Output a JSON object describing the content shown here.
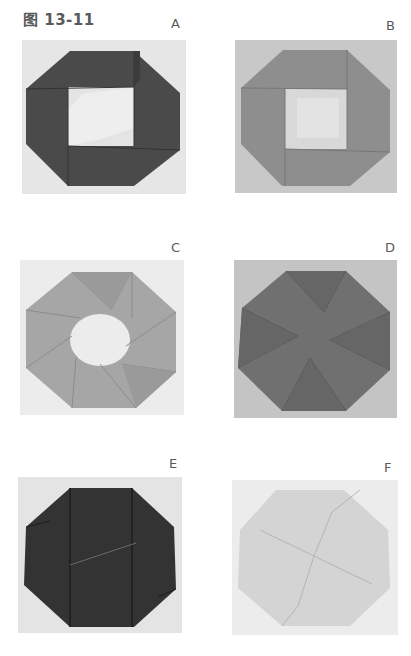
{
  "figure": {
    "caption": "图 13-11",
    "panels": [
      {
        "id": "A",
        "label": "A",
        "subject": "dark octagonal origami frame with square opening",
        "paper_color": "#4a4a4a",
        "background_color": "#e6e6e6"
      },
      {
        "id": "B",
        "label": "B",
        "subject": "medium-gray octagonal origami frame with square opening",
        "paper_color": "#8e8e8e",
        "background_color": "#c8c8c8"
      },
      {
        "id": "C",
        "label": "C",
        "subject": "light-gray octagonal pinwheel origami ring with round opening",
        "paper_color": "#a6a6a6",
        "background_color": "#ececec"
      },
      {
        "id": "D",
        "label": "D",
        "subject": "dark-gray closed octagonal pinwheel origami",
        "paper_color": "#707070",
        "background_color": "#c4c4c4"
      },
      {
        "id": "E",
        "label": "E",
        "subject": "near-black closed octagonal origami",
        "paper_color": "#333333",
        "background_color": "#e4e4e4"
      },
      {
        "id": "F",
        "label": "F",
        "subject": "pale-gray closed octagonal origami with four interlocking squares",
        "paper_color": "#d4d4d4",
        "background_color": "#ececec"
      }
    ]
  }
}
